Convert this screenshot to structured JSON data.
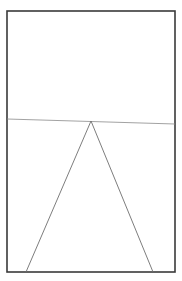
{
  "figure": {
    "width": 182,
    "height": 281,
    "background": "#ffffff",
    "frame": {
      "x": 7,
      "y": 11,
      "width": 168,
      "height": 261,
      "stroke": "#3a3a3a",
      "stroke_width": 1.6
    },
    "horizon_line": {
      "x1": 7,
      "y1": 119,
      "x2": 175,
      "y2": 124,
      "stroke": "#8a8a8a",
      "stroke_width": 0.8
    },
    "triangle": {
      "apex": [
        91,
        121
      ],
      "base_left": [
        26,
        272
      ],
      "base_right": [
        153,
        272
      ],
      "stroke": "#6e6e6e",
      "stroke_width": 0.9
    }
  }
}
